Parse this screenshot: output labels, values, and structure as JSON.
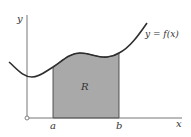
{
  "figure": {
    "axes": {
      "x_label": "x",
      "y_label": "y"
    },
    "curve_label": "y = f(x)",
    "region_label": "R",
    "bounds": {
      "left_label": "a",
      "right_label": "b"
    },
    "colors": {
      "curve": "#2e2e2e",
      "axis": "#555555",
      "shade": "#a9a9a9",
      "background": "#ffffff"
    }
  }
}
